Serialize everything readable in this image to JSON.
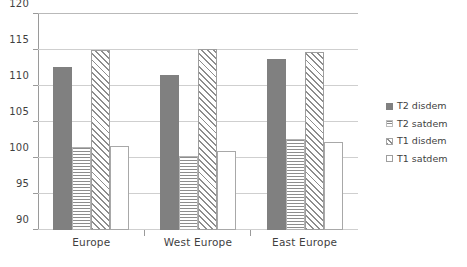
{
  "chart_data": {
    "type": "bar",
    "title": "",
    "xlabel": "",
    "ylabel": "",
    "categories": [
      "Europe",
      "West Europe",
      "East Europe"
    ],
    "series": [
      {
        "name": "T2 disdem",
        "pattern": "solid",
        "values": [
          112.7,
          111.5,
          113.8
        ]
      },
      {
        "name": "T2 satdem",
        "pattern": "hlines",
        "values": [
          101.5,
          100.3,
          102.6
        ]
      },
      {
        "name": "T1 disdem",
        "pattern": "diag",
        "values": [
          115.0,
          115.2,
          114.7
        ]
      },
      {
        "name": "T1 satdem",
        "pattern": "open",
        "values": [
          101.7,
          101.0,
          102.2
        ]
      }
    ],
    "ylim": [
      90,
      120
    ],
    "ytick_step": 5,
    "yticks": [
      "90",
      "95",
      "100",
      "105",
      "110",
      "115",
      "120"
    ],
    "grid": true,
    "legend_position": "right",
    "colors": {
      "bar_gray": "#808080",
      "grid": "#cfcfcf",
      "axis": "#9a9a9a",
      "text": "#3f3f3f",
      "background": "#ffffff"
    }
  }
}
